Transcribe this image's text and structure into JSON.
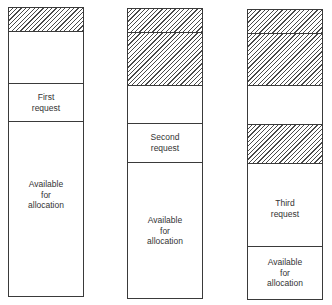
{
  "diagram": {
    "type": "memory-allocation-sequence",
    "columns": [
      {
        "name": "after-first-request",
        "segments": [
          {
            "kind": "allocated",
            "label": ""
          },
          {
            "kind": "free",
            "label": ""
          },
          {
            "kind": "request",
            "label_lines": [
              "First",
              "request"
            ]
          },
          {
            "kind": "available",
            "label_lines": [
              "Available",
              "for",
              "allocation"
            ]
          }
        ]
      },
      {
        "name": "after-second-request",
        "segments": [
          {
            "kind": "allocated",
            "label": ""
          },
          {
            "kind": "allocated",
            "label": ""
          },
          {
            "kind": "free",
            "label": ""
          },
          {
            "kind": "request",
            "label_lines": [
              "Second",
              "request"
            ]
          },
          {
            "kind": "available",
            "label_lines": [
              "Available",
              "for",
              "allocation"
            ]
          }
        ]
      },
      {
        "name": "after-third-request",
        "segments": [
          {
            "kind": "allocated",
            "label": ""
          },
          {
            "kind": "allocated",
            "label": ""
          },
          {
            "kind": "free",
            "label": ""
          },
          {
            "kind": "allocated",
            "label": ""
          },
          {
            "kind": "request",
            "label_lines": [
              "Third",
              "request"
            ]
          },
          {
            "kind": "available",
            "label_lines": [
              "Available",
              "for",
              "allocation"
            ]
          }
        ]
      }
    ]
  },
  "labels": {
    "c1_req_1": "First",
    "c1_req_2": "request",
    "c1_av_1": "Available",
    "c1_av_2": "for",
    "c1_av_3": "allocation",
    "c2_req_1": "Second",
    "c2_req_2": "request",
    "c2_av_1": "Available",
    "c2_av_2": "for",
    "c2_av_3": "allocation",
    "c3_req_1": "Third",
    "c3_req_2": "request",
    "c3_av_1": "Available",
    "c3_av_2": "for",
    "c3_av_3": "allocation"
  }
}
